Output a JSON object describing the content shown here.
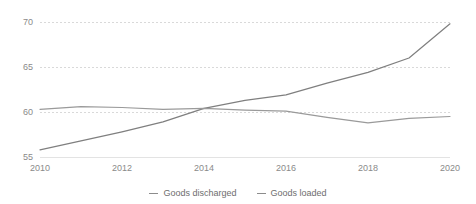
{
  "chart_data": {
    "type": "line",
    "title": "",
    "subtitle": "",
    "xlabel": "",
    "ylabel": "",
    "x": [
      2010,
      2011,
      2012,
      2013,
      2014,
      2015,
      2016,
      2017,
      2018,
      2019,
      2020
    ],
    "xlim": [
      2010,
      2020
    ],
    "ylim": [
      55,
      70
    ],
    "xtick_labels": [
      "2010",
      "2012",
      "2014",
      "2016",
      "2018",
      "2020"
    ],
    "xticks": [
      2010,
      2012,
      2014,
      2016,
      2018,
      2020
    ],
    "ytick_labels": [
      "55",
      "60",
      "65",
      "70"
    ],
    "yticks": [
      55,
      60,
      65,
      70
    ],
    "grid": "horizontal-dashed",
    "legend_position": "bottom-center",
    "series": [
      {
        "name": "Goods discharged",
        "color": "#7f7f7f",
        "values": [
          55.8,
          56.8,
          57.8,
          58.9,
          60.4,
          61.3,
          61.9,
          63.2,
          64.4,
          66.0,
          69.8
        ]
      },
      {
        "name": "Goods loaded",
        "color": "#9a9a9a",
        "values": [
          60.3,
          60.6,
          60.5,
          60.3,
          60.4,
          60.2,
          60.1,
          59.4,
          58.8,
          59.3,
          59.5
        ]
      }
    ]
  },
  "legend": {
    "items": [
      {
        "label": "Goods discharged"
      },
      {
        "label": "Goods loaded"
      }
    ]
  },
  "axes": {
    "y_labels": [
      "70",
      "65",
      "60",
      "55"
    ],
    "x_labels": [
      "2010",
      "2012",
      "2014",
      "2016",
      "2018",
      "2020"
    ]
  }
}
